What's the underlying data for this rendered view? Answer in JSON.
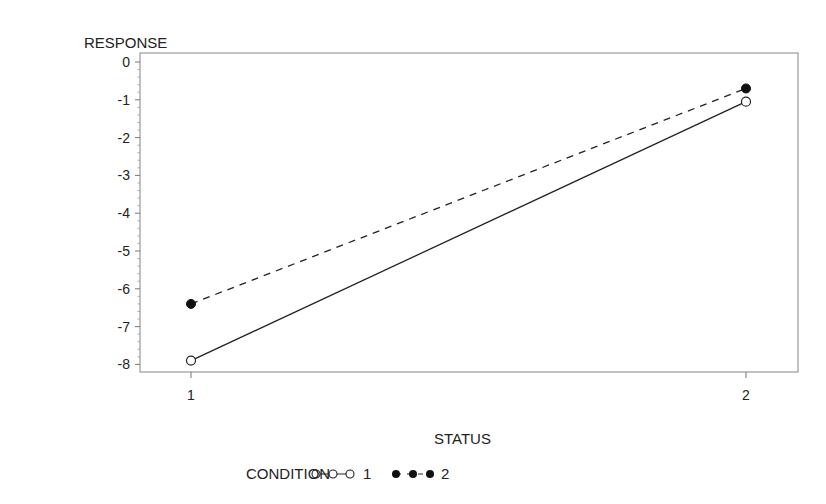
{
  "chart_data": {
    "type": "line",
    "title": "",
    "xlabel": "STATUS",
    "ylabel": "RESPONSE",
    "categories": [
      "1",
      "2"
    ],
    "x": [
      1,
      2
    ],
    "ylim": [
      -8.2,
      0.2
    ],
    "yticks": [
      0,
      -1,
      -2,
      -3,
      -4,
      -5,
      -6,
      -7,
      -8
    ],
    "ytick_labels": [
      "0",
      "-1",
      "-2",
      "-3",
      "-4",
      "-5",
      "-6",
      "-7",
      "-8"
    ],
    "xtick_labels": [
      "1",
      "2"
    ],
    "grid": false,
    "legend_position": "bottom",
    "legend_title": "CONDITION",
    "series": [
      {
        "name": "1",
        "values": [
          -7.9,
          -1.05
        ],
        "line": "solid",
        "marker": "open-circle",
        "color": "#222222"
      },
      {
        "name": "2",
        "values": [
          -6.4,
          -0.7
        ],
        "line": "dashed",
        "marker": "filled-circle",
        "color": "#111111"
      }
    ]
  },
  "legend": {
    "title": "CONDITION",
    "items": [
      {
        "label": "1"
      },
      {
        "label": "2"
      }
    ]
  }
}
